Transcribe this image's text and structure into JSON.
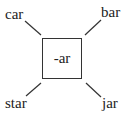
{
  "diagram": {
    "center": {
      "label": "-ar"
    },
    "words": {
      "top_left": "car",
      "top_right": "bar",
      "bottom_left": "star",
      "bottom_right": "jar"
    },
    "colors": {
      "line": "#333333",
      "text": "#222222",
      "background": "#ffffff"
    }
  }
}
